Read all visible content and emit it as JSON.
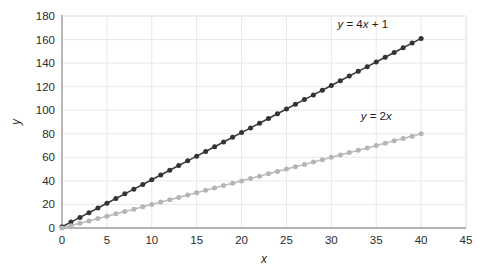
{
  "chart_data": {
    "type": "line",
    "title": "",
    "subtitle": "",
    "xlabel": "x",
    "ylabel": "y",
    "xlim": [
      0,
      45
    ],
    "ylim": [
      0,
      180
    ],
    "xticks": [
      0,
      5,
      10,
      15,
      20,
      25,
      30,
      35,
      40,
      45
    ],
    "xtick_labels": [
      "0",
      "5",
      "10",
      "15",
      "20",
      "25",
      "30",
      "35",
      "40",
      "45"
    ],
    "yticks": [
      0,
      20,
      40,
      60,
      80,
      100,
      120,
      140,
      160,
      180
    ],
    "ytick_labels": [
      "0",
      "20",
      "40",
      "60",
      "80",
      "100",
      "120",
      "140",
      "160",
      "180"
    ],
    "grid": true,
    "grid_color": "#e8e8e8",
    "axis_color": "#9a9a9a",
    "background": "#ffffff",
    "legend": "inline-annotations",
    "marker": "circle",
    "x": [
      0,
      1,
      2,
      3,
      4,
      5,
      6,
      7,
      8,
      9,
      10,
      11,
      12,
      13,
      14,
      15,
      16,
      17,
      18,
      19,
      20,
      21,
      22,
      23,
      24,
      25,
      26,
      27,
      28,
      29,
      30,
      31,
      32,
      33,
      34,
      35,
      36,
      37,
      38,
      39,
      40
    ],
    "series": [
      {
        "name": "y = 4x + 1",
        "label_text": "y = 4x + 1",
        "color": "#3d3d3d",
        "marker_color": "#333333",
        "values": [
          1,
          5,
          9,
          13,
          17,
          21,
          25,
          29,
          33,
          37,
          41,
          45,
          49,
          53,
          57,
          61,
          65,
          69,
          73,
          77,
          81,
          85,
          89,
          93,
          97,
          101,
          105,
          109,
          113,
          117,
          121,
          125,
          129,
          133,
          137,
          141,
          145,
          149,
          153,
          157,
          161
        ],
        "annotation": {
          "x": 33.5,
          "y": 170
        }
      },
      {
        "name": "y = 2x",
        "label_text": "y = 2x",
        "color": "#bdbdbd",
        "marker_color": "#b5b5b5",
        "values": [
          0,
          2,
          4,
          6,
          8,
          10,
          12,
          14,
          16,
          18,
          20,
          22,
          24,
          26,
          28,
          30,
          32,
          34,
          36,
          38,
          40,
          42,
          44,
          46,
          48,
          50,
          52,
          54,
          56,
          58,
          60,
          62,
          64,
          66,
          68,
          70,
          72,
          74,
          76,
          78,
          80
        ],
        "annotation": {
          "x": 35.0,
          "y": 92
        }
      }
    ]
  }
}
